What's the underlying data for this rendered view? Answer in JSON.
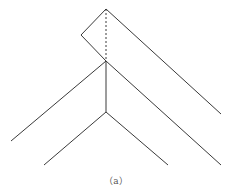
{
  "figure": {
    "caption": "（a）",
    "stroke_color": "#3a3a3a",
    "lines": [
      {
        "id": "top-left-edge",
        "x1": 106,
        "y1": 9,
        "x2": 81,
        "y2": 35,
        "style": "solid"
      },
      {
        "id": "top-right-long-edge",
        "x1": 106,
        "y1": 9,
        "x2": 221,
        "y2": 114,
        "style": "solid"
      },
      {
        "id": "left-corner-to-junction",
        "x1": 81,
        "y1": 35,
        "x2": 106,
        "y2": 61,
        "style": "solid"
      },
      {
        "id": "junction-to-right-lower",
        "x1": 106,
        "y1": 61,
        "x2": 221,
        "y2": 165,
        "style": "solid"
      },
      {
        "id": "junction-to-left-outer",
        "x1": 106,
        "y1": 61,
        "x2": 11,
        "y2": 141,
        "style": "solid"
      },
      {
        "id": "vertical-stem",
        "x1": 106,
        "y1": 61,
        "x2": 106,
        "y2": 112,
        "style": "solid"
      },
      {
        "id": "dashed-axis",
        "x1": 106,
        "y1": 9,
        "x2": 106,
        "y2": 61,
        "style": "dashed"
      },
      {
        "id": "inner-left",
        "x1": 106,
        "y1": 112,
        "x2": 44,
        "y2": 165,
        "style": "solid"
      },
      {
        "id": "inner-right",
        "x1": 106,
        "y1": 112,
        "x2": 168,
        "y2": 165,
        "style": "solid"
      }
    ]
  }
}
